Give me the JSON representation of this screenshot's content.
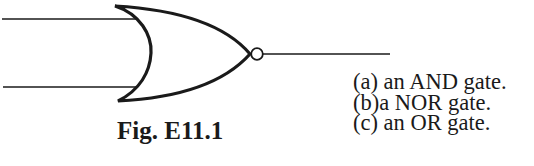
{
  "figure": {
    "caption": "Fig. E11.1",
    "gate_symbol": "nor-gate",
    "inputs": 2,
    "outputs": 1,
    "line_color": "#1a1a1a"
  },
  "options": [
    {
      "label": "(a)",
      "text": " an AND gate."
    },
    {
      "label": "(b)",
      "text": "a NOR gate."
    },
    {
      "label": "(c)",
      "text": " an OR gate."
    }
  ]
}
